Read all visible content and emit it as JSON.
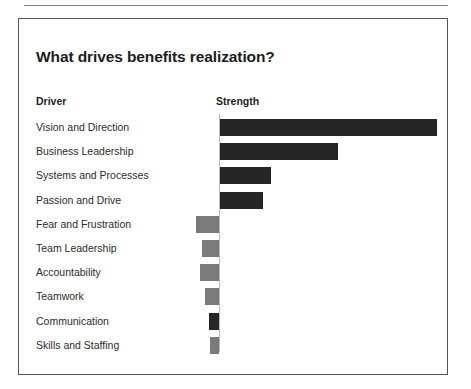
{
  "panel": {
    "title": "What drives benefits realization?",
    "columns": {
      "driver_header": "Driver",
      "strength_header": "Strength"
    }
  },
  "chart_data": {
    "type": "bar",
    "orientation": "horizontal",
    "title": "What drives benefits realization?",
    "xlabel": "Strength",
    "ylabel": "Driver",
    "grid": false,
    "legend": null,
    "axis_tick_labels": [],
    "zero_axis": true,
    "xlim": [
      -40,
      240
    ],
    "categories": [
      "Vision and Direction",
      "Business Leadership",
      "Systems and Processes",
      "Passion and Drive",
      "Fear and Frustration",
      "Team Leadership",
      "Accountability",
      "Teamwork",
      "Communication",
      "Skills and Staffing"
    ],
    "values": [
      217,
      118,
      51,
      43,
      -23,
      -17,
      -19,
      -14,
      -10,
      -9
    ],
    "bar_colors": [
      "#262626",
      "#262626",
      "#262626",
      "#262626",
      "#7a7a7a",
      "#7a7a7a",
      "#7a7a7a",
      "#7a7a7a",
      "#262626",
      "#7a7a7a"
    ]
  },
  "colors": {
    "positive_bar": "#262626",
    "negative_bar": "#7a7a7a",
    "panel_border": "#555555",
    "axis": "#b9b9b9",
    "text": "#2b2b2b"
  }
}
